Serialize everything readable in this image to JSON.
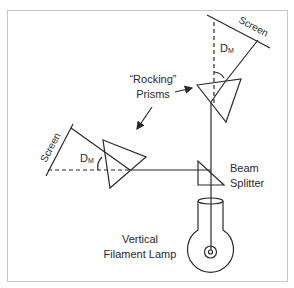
{
  "diagram": {
    "labels": {
      "screen_top": "Screen",
      "screen_left": "Screen",
      "dm_top": "D",
      "dm_top_sub": "M",
      "dm_left": "D",
      "dm_left_sub": "M",
      "prisms_line1": "“Rocking”",
      "prisms_line2": "Prisms",
      "beam_splitter_line1": "Beam",
      "beam_splitter_line2": "Splitter",
      "lamp_line1": "Vertical",
      "lamp_line2": "Filament Lamp"
    },
    "colors": {
      "line": "#2a2a2a",
      "frame": "#c8c8c8",
      "background": "#ffffff"
    }
  }
}
